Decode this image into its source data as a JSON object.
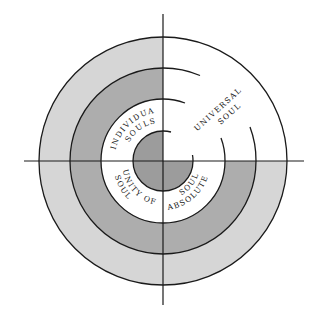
{
  "diagram": {
    "type": "concentric-quadrant-diagram",
    "center": [
      163,
      161
    ],
    "radii": {
      "outer": 124,
      "ring2": 93,
      "ring3": 62,
      "core": 30
    },
    "colors": {
      "outer_ring": "#d6d6d6",
      "middle_ring": "#adadad",
      "core": "#9c9c9c",
      "white": "#ffffff",
      "stroke": "#1a1a1a"
    },
    "quadrants": [
      {
        "position": "upper-left",
        "label_line1": "INDIVIDUAL",
        "label_line2": "SOULS"
      },
      {
        "position": "upper-right",
        "label_line1": "UNIVERSAL",
        "label_line2": "SOUL"
      },
      {
        "position": "lower-left",
        "label_line1": "UNITY OF",
        "label_line2": "SOUL"
      },
      {
        "position": "lower-right",
        "label_line1": "ABSOLUTE",
        "label_line2": "SOUL"
      }
    ]
  }
}
